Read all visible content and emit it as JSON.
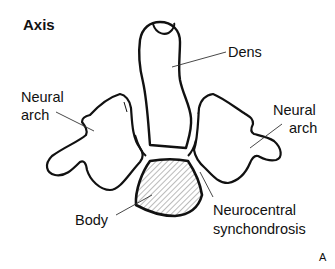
{
  "title": "Axis",
  "labels": {
    "dens": "Dens",
    "neural_arch_left_line1": "Neural",
    "neural_arch_left_line2": "arch",
    "neural_arch_right_line1": "Neural",
    "neural_arch_right_line2": "arch",
    "body": "Body",
    "neurocentral_line1": "Neurocentral",
    "neurocentral_line2": "synchondrosis"
  },
  "panel_letter": "A",
  "colors": {
    "ink": "#111111",
    "background": "#ffffff"
  }
}
